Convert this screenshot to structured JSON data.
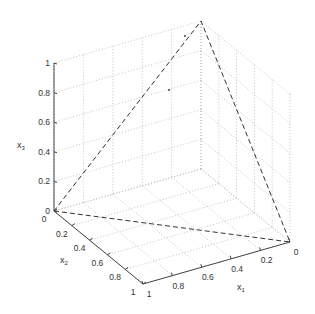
{
  "chart_data": {
    "type": "3d-line",
    "title": "",
    "xlabel": "x_1",
    "ylabel": "x_2",
    "zlabel": "x_3",
    "axes": {
      "x1": {
        "label": "x",
        "sub": "1",
        "range": [
          0,
          1
        ],
        "ticks": [
          0,
          0.2,
          0.4,
          0.6,
          0.8,
          1
        ],
        "tick_labels": [
          "0",
          "0.2",
          "0.4",
          "0.6",
          "0.8",
          "1"
        ]
      },
      "x2": {
        "label": "x",
        "sub": "2",
        "range": [
          0,
          1
        ],
        "ticks": [
          0,
          0.2,
          0.4,
          0.6,
          0.8,
          1
        ],
        "tick_labels": [
          "0",
          "0.2",
          "0.4",
          "0.6",
          "0.8",
          "1"
        ]
      },
      "x3": {
        "label": "x",
        "sub": "3",
        "range": [
          0,
          1
        ],
        "ticks": [
          0,
          0.2,
          0.4,
          0.6,
          0.8,
          1
        ],
        "tick_labels": [
          "0",
          "0.2",
          "0.4",
          "0.6",
          "0.8",
          "1"
        ]
      }
    },
    "grid": true,
    "grid_style": "dotted",
    "series": [
      {
        "name": "simplex-boundary",
        "style": "dashed",
        "color": "#333333",
        "points": [
          [
            1,
            0,
            0
          ],
          [
            0,
            1,
            0
          ],
          [
            0,
            0,
            1
          ],
          [
            1,
            0,
            0
          ]
        ]
      }
    ],
    "markers": [
      {
        "name": "point-a",
        "px": [
          185,
          36
        ]
      },
      {
        "name": "point-b",
        "px": [
          169,
          90
        ]
      }
    ],
    "projection": {
      "origin_px": [
        201,
        169
      ],
      "e1_px": [
        -147,
        42
      ],
      "e2_px": [
        89,
        73
      ],
      "e3_px": [
        0,
        -148
      ]
    }
  },
  "colors": {
    "background": "#ffffff",
    "axis": "#444444",
    "grid": "#b5b5b5",
    "series": "#333333"
  }
}
